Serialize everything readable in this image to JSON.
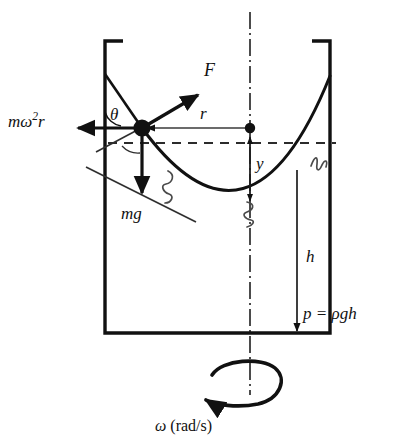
{
  "figure": {
    "labels": {
      "centrifugal_force": "mω²r",
      "centrifugal_force_base": "mω",
      "centrifugal_force_exponent": "2",
      "centrifugal_force_tail": "r",
      "resultant_force": "F",
      "radius": "r",
      "angle": "θ",
      "weight": "mg",
      "surface_height": "y",
      "depth": "h",
      "pressure_equation": "p = ρgh",
      "angular_velocity": "ω",
      "angular_velocity_units": "(rad/s)"
    },
    "colors": {
      "ink": "#111111",
      "background": "#ffffff",
      "thin_line": "#3a3a3a"
    },
    "geometry": {
      "container": {
        "left_wall_x": 105,
        "right_wall_x": 330,
        "top_y": 38,
        "bottom_y": 333,
        "lip_length": 18
      },
      "axis_x": 250,
      "particle": {
        "x": 142,
        "y": 128
      },
      "axis_point": {
        "x": 250,
        "y": 128
      },
      "parabola_vertex": {
        "x": 250,
        "y": 203
      },
      "dashed_line_y": 143,
      "depth_line_x": 297,
      "force_arrow_tip": {
        "x": 201,
        "y": 92
      },
      "weight_arrow_tip": {
        "x": 142,
        "y": 196
      },
      "centrifugal_arrow_tip": {
        "x": 73,
        "y": 128
      }
    }
  }
}
